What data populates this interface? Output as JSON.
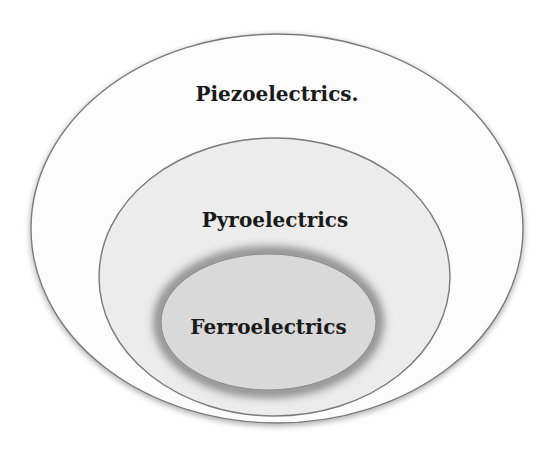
{
  "diagram": {
    "type": "nested-venn",
    "sets": [
      {
        "id": "piezoelectrics",
        "label": "Piezoelectrics.",
        "fill": "#fcfcfc",
        "stroke": "#7a7a7a",
        "ellipse": {
          "cx": 277,
          "cy": 228.5,
          "rx": 246,
          "ry": 194.5
        },
        "label_pos": {
          "x": 277,
          "y": 101
        }
      },
      {
        "id": "pyroelectrics",
        "label": "Pyroelectrics",
        "fill": "#ececec",
        "stroke": "#7a7a7a",
        "ellipse": {
          "cx": 274.5,
          "cy": 277,
          "rx": 175.5,
          "ry": 139
        },
        "label_pos": {
          "x": 275,
          "y": 227
        }
      },
      {
        "id": "ferroelectrics",
        "label": "Ferroelectrics",
        "fill": "#d9d9d9",
        "stroke": "#8a8a8a",
        "glow": "#5a5a5a",
        "ellipse": {
          "cx": 268.5,
          "cy": 322,
          "rx": 107.5,
          "ry": 68
        },
        "label_pos": {
          "x": 268.5,
          "y": 334
        }
      }
    ]
  }
}
